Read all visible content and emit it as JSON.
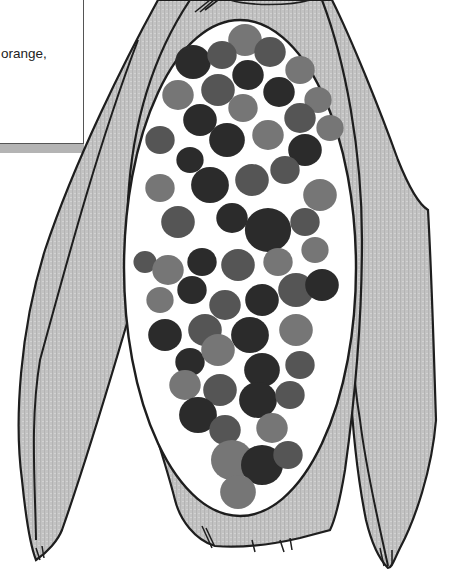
{
  "text_box": {
    "caption": "orange,"
  },
  "illustration": {
    "subject": "ear-of-corn",
    "colors": {
      "husk_fill": "#c4c4c4",
      "outline": "#1e1e1e",
      "cob_background": "#ffffff",
      "kernel_dark": "#2b2b2b",
      "kernel_medium": "#555555",
      "kernel_light": "#767676"
    },
    "kernels": [
      [
        245,
        40,
        16,
        "light"
      ],
      [
        193,
        62,
        17,
        "dark"
      ],
      [
        222,
        55,
        14,
        "medium"
      ],
      [
        270,
        52,
        15,
        "medium"
      ],
      [
        300,
        70,
        14,
        "light"
      ],
      [
        248,
        75,
        15,
        "dark"
      ],
      [
        178,
        95,
        15,
        "light"
      ],
      [
        218,
        90,
        16,
        "medium"
      ],
      [
        279,
        92,
        15,
        "dark"
      ],
      [
        318,
        100,
        13,
        "light"
      ],
      [
        200,
        120,
        16,
        "dark"
      ],
      [
        243,
        108,
        14,
        "light"
      ],
      [
        300,
        118,
        15,
        "medium"
      ],
      [
        160,
        140,
        14,
        "medium"
      ],
      [
        227,
        140,
        17,
        "dark"
      ],
      [
        268,
        135,
        15,
        "light"
      ],
      [
        330,
        128,
        13,
        "light"
      ],
      [
        190,
        160,
        13,
        "dark"
      ],
      [
        305,
        150,
        16,
        "dark"
      ],
      [
        160,
        188,
        14,
        "light"
      ],
      [
        210,
        185,
        18,
        "dark"
      ],
      [
        252,
        180,
        16,
        "medium"
      ],
      [
        285,
        170,
        14,
        "medium"
      ],
      [
        320,
        195,
        16,
        "light"
      ],
      [
        178,
        222,
        16,
        "medium"
      ],
      [
        232,
        218,
        15,
        "dark"
      ],
      [
        268,
        230,
        22,
        "dark"
      ],
      [
        305,
        222,
        14,
        "medium"
      ],
      [
        145,
        262,
        11,
        "medium"
      ],
      [
        168,
        270,
        15,
        "light"
      ],
      [
        202,
        262,
        14,
        "dark"
      ],
      [
        238,
        265,
        16,
        "medium"
      ],
      [
        278,
        262,
        14,
        "light"
      ],
      [
        315,
        250,
        13,
        "light"
      ],
      [
        160,
        300,
        13,
        "light"
      ],
      [
        192,
        290,
        14,
        "dark"
      ],
      [
        225,
        305,
        15,
        "medium"
      ],
      [
        262,
        300,
        16,
        "dark"
      ],
      [
        296,
        290,
        17,
        "medium"
      ],
      [
        322,
        285,
        16,
        "dark"
      ],
      [
        165,
        335,
        16,
        "dark"
      ],
      [
        205,
        330,
        16,
        "medium"
      ],
      [
        250,
        335,
        18,
        "dark"
      ],
      [
        296,
        330,
        16,
        "light"
      ],
      [
        190,
        362,
        14,
        "dark"
      ],
      [
        218,
        350,
        16,
        "light"
      ],
      [
        262,
        370,
        17,
        "dark"
      ],
      [
        300,
        365,
        14,
        "medium"
      ],
      [
        185,
        385,
        15,
        "light"
      ],
      [
        220,
        390,
        16,
        "medium"
      ],
      [
        258,
        400,
        18,
        "dark"
      ],
      [
        290,
        395,
        14,
        "medium"
      ],
      [
        198,
        415,
        18,
        "dark"
      ],
      [
        225,
        430,
        15,
        "medium"
      ],
      [
        272,
        428,
        15,
        "light"
      ],
      [
        232,
        460,
        20,
        "light"
      ],
      [
        262,
        465,
        20,
        "dark"
      ],
      [
        288,
        455,
        14,
        "medium"
      ],
      [
        238,
        492,
        17,
        "light"
      ]
    ]
  }
}
